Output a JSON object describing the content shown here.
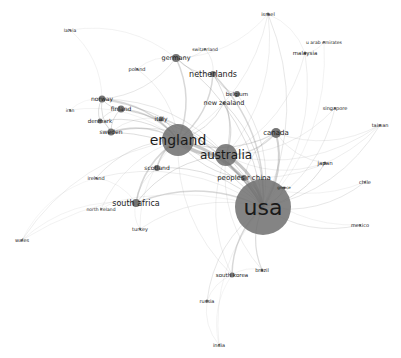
{
  "diagram": {
    "type": "network",
    "title": "",
    "background": "#ffffff",
    "node_color": "#6e6e6e",
    "edge_color": "#8a8a8a",
    "label_color": "#1a1a1a",
    "nodes": [
      {
        "id": "usa",
        "label": "usa",
        "x": 263,
        "y": 207,
        "r": 28,
        "font": 22,
        "fill": "#6a6a6a"
      },
      {
        "id": "england",
        "label": "england",
        "x": 178,
        "y": 140,
        "r": 16,
        "font": 14,
        "fill": "#7c7c7c"
      },
      {
        "id": "australia",
        "label": "australia",
        "x": 226,
        "y": 155,
        "r": 11,
        "font": 12,
        "fill": "#777777"
      },
      {
        "id": "canada",
        "label": "canada",
        "x": 276,
        "y": 133,
        "r": 5,
        "font": 7,
        "fill": "#6e6e6e"
      },
      {
        "id": "peoples-r-china",
        "label": "peoples r china",
        "x": 244,
        "y": 178,
        "r": 3,
        "font": 7,
        "fill": "#6e6e6e"
      },
      {
        "id": "greece",
        "label": "greece",
        "x": 284,
        "y": 188,
        "r": 1.5,
        "font": 4,
        "fill": "#6e6e6e"
      },
      {
        "id": "netherlands",
        "label": "netherlands",
        "x": 213,
        "y": 74,
        "r": 3,
        "font": 8,
        "fill": "#6e6e6e"
      },
      {
        "id": "belgium",
        "label": "belgium",
        "x": 237,
        "y": 94,
        "r": 3,
        "font": 5.5,
        "fill": "#6e6e6e"
      },
      {
        "id": "new-zealand",
        "label": "new zealand",
        "x": 224,
        "y": 103,
        "r": 1.5,
        "font": 6.5,
        "fill": "#6e6e6e"
      },
      {
        "id": "germany",
        "label": "germany",
        "x": 176,
        "y": 58,
        "r": 4,
        "font": 6.5,
        "fill": "#6e6e6e"
      },
      {
        "id": "switzerland",
        "label": "switzerland",
        "x": 205,
        "y": 49,
        "r": 1,
        "font": 4.5,
        "fill": "#6e6e6e"
      },
      {
        "id": "poland",
        "label": "poland",
        "x": 137,
        "y": 69,
        "r": 1,
        "font": 5,
        "fill": "#6e6e6e"
      },
      {
        "id": "latvia",
        "label": "latvia",
        "x": 70,
        "y": 30,
        "r": 1,
        "font": 4.5,
        "fill": "#6e6e6e"
      },
      {
        "id": "norway",
        "label": "norway",
        "x": 102,
        "y": 99,
        "r": 3.5,
        "font": 6,
        "fill": "#6e6e6e"
      },
      {
        "id": "finland",
        "label": "finland",
        "x": 121,
        "y": 109,
        "r": 3.5,
        "font": 6,
        "fill": "#6e6e6e"
      },
      {
        "id": "iran",
        "label": "iran",
        "x": 70,
        "y": 110,
        "r": 1,
        "font": 4.5,
        "fill": "#6e6e6e"
      },
      {
        "id": "denmark",
        "label": "denmark",
        "x": 100,
        "y": 121,
        "r": 2.5,
        "font": 5.5,
        "fill": "#6e6e6e"
      },
      {
        "id": "sweden",
        "label": "sweden",
        "x": 111,
        "y": 132,
        "r": 3.5,
        "font": 6,
        "fill": "#6e6e6e"
      },
      {
        "id": "italy",
        "label": "italy",
        "x": 161,
        "y": 119,
        "r": 2.5,
        "font": 6,
        "fill": "#6e6e6e"
      },
      {
        "id": "scotland",
        "label": "scotland",
        "x": 157,
        "y": 168,
        "r": 3,
        "font": 6,
        "fill": "#6e6e6e"
      },
      {
        "id": "ireland",
        "label": "ireland",
        "x": 96,
        "y": 178,
        "r": 1,
        "font": 5,
        "fill": "#6e6e6e"
      },
      {
        "id": "south-africa",
        "label": "south africa",
        "x": 136,
        "y": 203,
        "r": 4,
        "font": 8,
        "fill": "#555555"
      },
      {
        "id": "north-ireland",
        "label": "north ireland",
        "x": 101,
        "y": 209,
        "r": 1,
        "font": 4.5,
        "fill": "#6e6e6e"
      },
      {
        "id": "turkey",
        "label": "turkey",
        "x": 140,
        "y": 229,
        "r": 1,
        "font": 5,
        "fill": "#6e6e6e"
      },
      {
        "id": "wales",
        "label": "wales",
        "x": 22,
        "y": 240,
        "r": 1,
        "font": 5,
        "fill": "#6e6e6e"
      },
      {
        "id": "south-korea",
        "label": "south korea",
        "x": 232,
        "y": 275,
        "r": 2.5,
        "font": 5.5,
        "fill": "#6e6e6e"
      },
      {
        "id": "brazil",
        "label": "brazil",
        "x": 262,
        "y": 270,
        "r": 1.5,
        "font": 5,
        "fill": "#6e6e6e"
      },
      {
        "id": "russia",
        "label": "russia",
        "x": 207,
        "y": 301,
        "r": 1.5,
        "font": 5,
        "fill": "#6e6e6e"
      },
      {
        "id": "india",
        "label": "india",
        "x": 219,
        "y": 345,
        "r": 1,
        "font": 5,
        "fill": "#6e6e6e"
      },
      {
        "id": "mexico",
        "label": "mexico",
        "x": 360,
        "y": 225,
        "r": 1,
        "font": 5,
        "fill": "#6e6e6e"
      },
      {
        "id": "chile",
        "label": "chile",
        "x": 365,
        "y": 182,
        "r": 1,
        "font": 5,
        "fill": "#6e6e6e"
      },
      {
        "id": "japan",
        "label": "japan",
        "x": 325,
        "y": 163,
        "r": 1.5,
        "font": 5.5,
        "fill": "#6e6e6e"
      },
      {
        "id": "taiwan",
        "label": "taiwan",
        "x": 380,
        "y": 125,
        "r": 1,
        "font": 5,
        "fill": "#6e6e6e"
      },
      {
        "id": "singapore",
        "label": "singapore",
        "x": 335,
        "y": 108,
        "r": 1,
        "font": 5,
        "fill": "#6e6e6e"
      },
      {
        "id": "malaysia",
        "label": "malaysia",
        "x": 305,
        "y": 53,
        "r": 1.5,
        "font": 5.5,
        "fill": "#6e6e6e"
      },
      {
        "id": "u-arab-emirates",
        "label": "u arab emirates",
        "x": 324,
        "y": 42,
        "r": 1,
        "font": 4.5,
        "fill": "#6e6e6e"
      },
      {
        "id": "israel",
        "label": "israel",
        "x": 268,
        "y": 14,
        "r": 1.5,
        "font": 5,
        "fill": "#6e6e6e"
      }
    ],
    "edges": [
      [
        "usa",
        "england",
        3
      ],
      [
        "usa",
        "australia",
        3
      ],
      [
        "england",
        "australia",
        3
      ],
      [
        "usa",
        "canada",
        2
      ],
      [
        "usa",
        "peoples-r-china",
        2
      ],
      [
        "usa",
        "greece",
        1
      ],
      [
        "usa",
        "netherlands",
        1.5
      ],
      [
        "usa",
        "germany",
        1
      ],
      [
        "usa",
        "south-africa",
        1.5
      ],
      [
        "usa",
        "south-korea",
        1.5
      ],
      [
        "usa",
        "brazil",
        1.2
      ],
      [
        "usa",
        "russia",
        0.8
      ],
      [
        "usa",
        "japan",
        1
      ],
      [
        "usa",
        "chile",
        0.8
      ],
      [
        "usa",
        "mexico",
        0.8
      ],
      [
        "usa",
        "taiwan",
        0.8
      ],
      [
        "usa",
        "singapore",
        0.7
      ],
      [
        "usa",
        "malaysia",
        0.6
      ],
      [
        "usa",
        "israel",
        0.8
      ],
      [
        "usa",
        "scotland",
        1
      ],
      [
        "usa",
        "italy",
        1
      ],
      [
        "usa",
        "sweden",
        1
      ],
      [
        "usa",
        "norway",
        1
      ],
      [
        "usa",
        "finland",
        1
      ],
      [
        "usa",
        "new-zealand",
        1
      ],
      [
        "usa",
        "belgium",
        0.8
      ],
      [
        "usa",
        "turkey",
        0.6
      ],
      [
        "usa",
        "ireland",
        0.6
      ],
      [
        "usa",
        "wales",
        0.5
      ],
      [
        "usa",
        "india",
        0.5
      ],
      [
        "usa",
        "u-arab-emirates",
        0.5
      ],
      [
        "england",
        "netherlands",
        1.5
      ],
      [
        "england",
        "germany",
        1.5
      ],
      [
        "england",
        "norway",
        1.5
      ],
      [
        "england",
        "finland",
        1.5
      ],
      [
        "england",
        "sweden",
        1.5
      ],
      [
        "england",
        "denmark",
        1
      ],
      [
        "england",
        "italy",
        1
      ],
      [
        "england",
        "scotland",
        1.5
      ],
      [
        "england",
        "south-africa",
        1.5
      ],
      [
        "england",
        "canada",
        1.2
      ],
      [
        "england",
        "peoples-r-china",
        1
      ],
      [
        "england",
        "new-zealand",
        1
      ],
      [
        "england",
        "ireland",
        0.8
      ],
      [
        "england",
        "wales",
        0.6
      ],
      [
        "england",
        "north-ireland",
        0.6
      ],
      [
        "england",
        "poland",
        0.6
      ],
      [
        "england",
        "iran",
        0.5
      ],
      [
        "england",
        "israel",
        0.6
      ],
      [
        "england",
        "turkey",
        0.5
      ],
      [
        "england",
        "south-korea",
        0.6
      ],
      [
        "australia",
        "canada",
        1.2
      ],
      [
        "australia",
        "peoples-r-china",
        1.2
      ],
      [
        "australia",
        "new-zealand",
        1.2
      ],
      [
        "australia",
        "netherlands",
        1
      ],
      [
        "australia",
        "south-africa",
        1
      ],
      [
        "australia",
        "norway",
        0.8
      ],
      [
        "australia",
        "sweden",
        0.8
      ],
      [
        "australia",
        "singapore",
        0.6
      ],
      [
        "australia",
        "malaysia",
        0.6
      ],
      [
        "australia",
        "taiwan",
        0.6
      ],
      [
        "australia",
        "japan",
        0.6
      ],
      [
        "australia",
        "israel",
        0.6
      ],
      [
        "australia",
        "brazil",
        0.6
      ],
      [
        "australia",
        "south-korea",
        0.6
      ],
      [
        "norway",
        "finland",
        1
      ],
      [
        "norway",
        "sweden",
        1
      ],
      [
        "norway",
        "denmark",
        1
      ],
      [
        "norway",
        "latvia",
        0.5
      ],
      [
        "norway",
        "germany",
        0.8
      ],
      [
        "norway",
        "iran",
        0.4
      ],
      [
        "finland",
        "sweden",
        1
      ],
      [
        "finland",
        "denmark",
        0.8
      ],
      [
        "germany",
        "netherlands",
        1
      ],
      [
        "germany",
        "switzerland",
        0.6
      ],
      [
        "germany",
        "poland",
        0.5
      ],
      [
        "germany",
        "latvia",
        0.5
      ],
      [
        "germany",
        "israel",
        0.5
      ],
      [
        "netherlands",
        "belgium",
        0.8
      ],
      [
        "netherlands",
        "switzerland",
        0.6
      ],
      [
        "canada",
        "peoples-r-china",
        0.8
      ],
      [
        "canada",
        "taiwan",
        0.6
      ],
      [
        "canada",
        "japan",
        0.6
      ],
      [
        "peoples-r-china",
        "taiwan",
        0.6
      ],
      [
        "peoples-r-china",
        "chile",
        0.5
      ],
      [
        "peoples-r-china",
        "mexico",
        0.5
      ],
      [
        "south-africa",
        "turkey",
        0.5
      ],
      [
        "south-africa",
        "wales",
        0.5
      ],
      [
        "south-africa",
        "ireland",
        0.5
      ],
      [
        "south-africa",
        "north-ireland",
        0.5
      ],
      [
        "south-korea",
        "russia",
        0.5
      ],
      [
        "russia",
        "india",
        0.5
      ],
      [
        "south-korea",
        "india",
        0.4
      ],
      [
        "brazil",
        "south-korea",
        0.5
      ],
      [
        "malaysia",
        "u-arab-emirates",
        0.5
      ],
      [
        "malaysia",
        "israel",
        0.5
      ],
      [
        "ireland",
        "wales",
        0.4
      ],
      [
        "scotland",
        "south-africa",
        0.6
      ],
      [
        "italy",
        "sweden",
        0.6
      ],
      [
        "sweden",
        "denmark",
        0.6
      ]
    ]
  }
}
